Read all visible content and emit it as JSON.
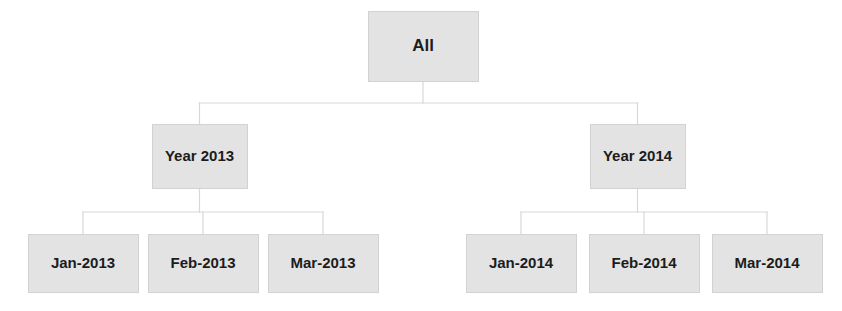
{
  "diagram": {
    "type": "tree",
    "background_color": "#ffffff",
    "node_fill_color": "#e3e3e3",
    "node_border_color": "#d2d2d2",
    "connector_color": "#d8d8d8",
    "text_color": "#1c1c1c",
    "levels": [
      {
        "level": 0,
        "name": "root-level",
        "nodes": [
          {
            "id": "all",
            "label": "All",
            "x": 368,
            "y": 11,
            "width": 110,
            "height": 70,
            "font_size": 17
          }
        ]
      },
      {
        "level": 1,
        "name": "year-level",
        "nodes": [
          {
            "id": "year-2013",
            "label": "Year 2013",
            "x": 152,
            "y": 124,
            "width": 95,
            "height": 64,
            "font_size": 15
          },
          {
            "id": "year-2014",
            "label": "Year 2014",
            "x": 590,
            "y": 124,
            "width": 95,
            "height": 64,
            "font_size": 15
          }
        ]
      },
      {
        "level": 2,
        "name": "month-level",
        "nodes": [
          {
            "id": "jan-2013",
            "label": "Jan-2013",
            "x": 28,
            "y": 234,
            "width": 110,
            "height": 58,
            "font_size": 15
          },
          {
            "id": "feb-2013",
            "label": "Feb-2013",
            "x": 148,
            "y": 234,
            "width": 110,
            "height": 58,
            "font_size": 15
          },
          {
            "id": "mar-2013",
            "label": "Mar-2013",
            "x": 268,
            "y": 234,
            "width": 110,
            "height": 58,
            "font_size": 15
          },
          {
            "id": "jan-2014",
            "label": "Jan-2014",
            "x": 466,
            "y": 234,
            "width": 110,
            "height": 58,
            "font_size": 15
          },
          {
            "id": "feb-2014",
            "label": "Feb-2014",
            "x": 589,
            "y": 234,
            "width": 110,
            "height": 58,
            "font_size": 15
          },
          {
            "id": "mar-2014",
            "label": "Mar-2014",
            "x": 712,
            "y": 234,
            "width": 110,
            "height": 58,
            "font_size": 15
          }
        ]
      }
    ],
    "connectors": [
      {
        "name": "all-to-years",
        "parent": "all",
        "children": [
          "year-2013",
          "year-2014"
        ],
        "bus_y": 103
      },
      {
        "name": "year2013-to-months",
        "parent": "year-2013",
        "children": [
          "jan-2013",
          "feb-2013",
          "mar-2013"
        ],
        "bus_y": 212
      },
      {
        "name": "year2014-to-months",
        "parent": "year-2014",
        "children": [
          "jan-2014",
          "feb-2014",
          "mar-2014"
        ],
        "bus_y": 212
      }
    ]
  }
}
